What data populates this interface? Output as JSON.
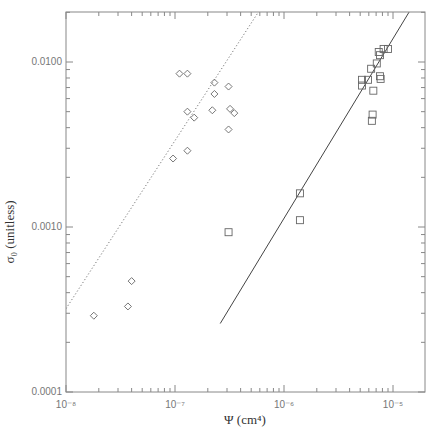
{
  "chart_data": {
    "type": "scatter",
    "title": "",
    "xlabel": "Ψ (cm⁴)",
    "ylabel": "σ₀ (unitless)",
    "xscale": "log",
    "yscale": "log",
    "xlim": [
      1e-08,
      2e-05
    ],
    "ylim": [
      0.0001,
      0.02
    ],
    "x_tick_labels": [
      "10⁻⁸",
      "10⁻⁷",
      "10⁻⁶",
      "10⁻⁵"
    ],
    "y_tick_labels": [
      "0.0001",
      "0.0010",
      "0.0100"
    ],
    "grid": false,
    "legend": null,
    "series": [
      {
        "name": "diamonds",
        "marker": "diamond",
        "points": [
          [
            1.8e-08,
            0.00029
          ],
          [
            3.7e-08,
            0.00033
          ],
          [
            4e-08,
            0.00047
          ],
          [
            9.6e-08,
            0.0026
          ],
          [
            1.3e-07,
            0.0029
          ],
          [
            1.1e-07,
            0.0085
          ],
          [
            1.3e-07,
            0.0085
          ],
          [
            1.5e-07,
            0.0046
          ],
          [
            1.3e-07,
            0.005
          ],
          [
            2.2e-07,
            0.0051
          ],
          [
            2.3e-07,
            0.0075
          ],
          [
            2.3e-07,
            0.0064
          ],
          [
            3.1e-07,
            0.0071
          ],
          [
            3.2e-07,
            0.0052
          ],
          [
            3.5e-07,
            0.0049
          ],
          [
            3.1e-07,
            0.0039
          ]
        ]
      },
      {
        "name": "squares",
        "marker": "square",
        "points": [
          [
            3.1e-07,
            0.00093
          ],
          [
            1.4e-06,
            0.0016
          ],
          [
            1.4e-06,
            0.0011
          ],
          [
            5.2e-06,
            0.0078
          ],
          [
            5.2e-06,
            0.0072
          ],
          [
            5.9e-06,
            0.0078
          ],
          [
            6.3e-06,
            0.0091
          ],
          [
            6.6e-06,
            0.0067
          ],
          [
            6.5e-06,
            0.0048
          ],
          [
            6.4e-06,
            0.0044
          ],
          [
            7.1e-06,
            0.0098
          ],
          [
            7.6e-06,
            0.0082
          ],
          [
            7.7e-06,
            0.0079
          ],
          [
            7.6e-06,
            0.011
          ],
          [
            8.2e-06,
            0.012
          ],
          [
            9e-06,
            0.012
          ],
          [
            7.4e-06,
            0.0115
          ]
        ]
      }
    ],
    "fit_lines": [
      {
        "name": "dotted fit (diamonds)",
        "style": "dotted",
        "from": [
          1e-08,
          0.00032
        ],
        "to": [
          5.8e-07,
          0.02
        ]
      },
      {
        "name": "solid fit (squares)",
        "style": "solid",
        "from": [
          2.6e-07,
          0.00026
        ],
        "to": [
          1.4e-05,
          0.02
        ]
      }
    ]
  }
}
